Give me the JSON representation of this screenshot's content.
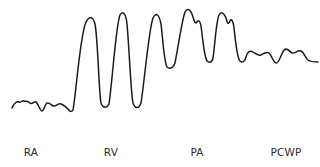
{
  "diagram": {
    "trace_color": "#1a1a1a",
    "chambers": [
      {
        "key": "ra",
        "label": "RA",
        "label_x": 31
      },
      {
        "key": "rv",
        "label": "RV",
        "label_x": 111
      },
      {
        "key": "pa",
        "label": "PA",
        "label_x": 197
      },
      {
        "key": "pcwp",
        "label": "PCWP",
        "label_x": 286
      }
    ],
    "waveform_path": "M12,108 C14,103 17,101 19,102 C21,103 22,100 24,101 C26,102 27,100 30,103 C32,105 34,101 36,102 C38,103 40,111 42,111 C44,111 45,104 47,103 C50,102 51,106 54,106 C57,106 58,103 61,104 C64,105 66,107 68,109 C70,112 72,112 73,110 C76,95 80,35 86,22 C89,16 93,16 95,24 C98,40 99,95 101,103 C103,109 107,108 109,104 C112,85 116,24 120,15 C123,10 126,14 127,24 C129,45 131,95 133,103 C135,109 139,109 141,103 C144,85 149,28 153,18 C156,12 159,14 161,24 C163,40 164,62 167,67 C169,69 173,69 175,63 C178,48 182,20 185,12 C187,8 190,9 192,14 C194,20 195,25 197,22 C198,20 200,20 201,26 C203,40 204,56 207,61 C209,63 212,63 213,58 C215,45 216,22 219,15 C221,11 224,13 226,18 C227,22 228,26 230,21 C231,18 233,20 234,28 C236,45 237,58 240,61 C242,63 245,62 246,57 C247,52 250,50 253,52 C256,54 258,56 261,55 C263,54 266,51 269,53 C272,56 273,62 276,63 C279,64 281,54 284,50 C287,47 289,51 292,53 C295,54 297,50 301,51 C304,52 305,58 308,60 C311,62 314,62 318,62"
  }
}
